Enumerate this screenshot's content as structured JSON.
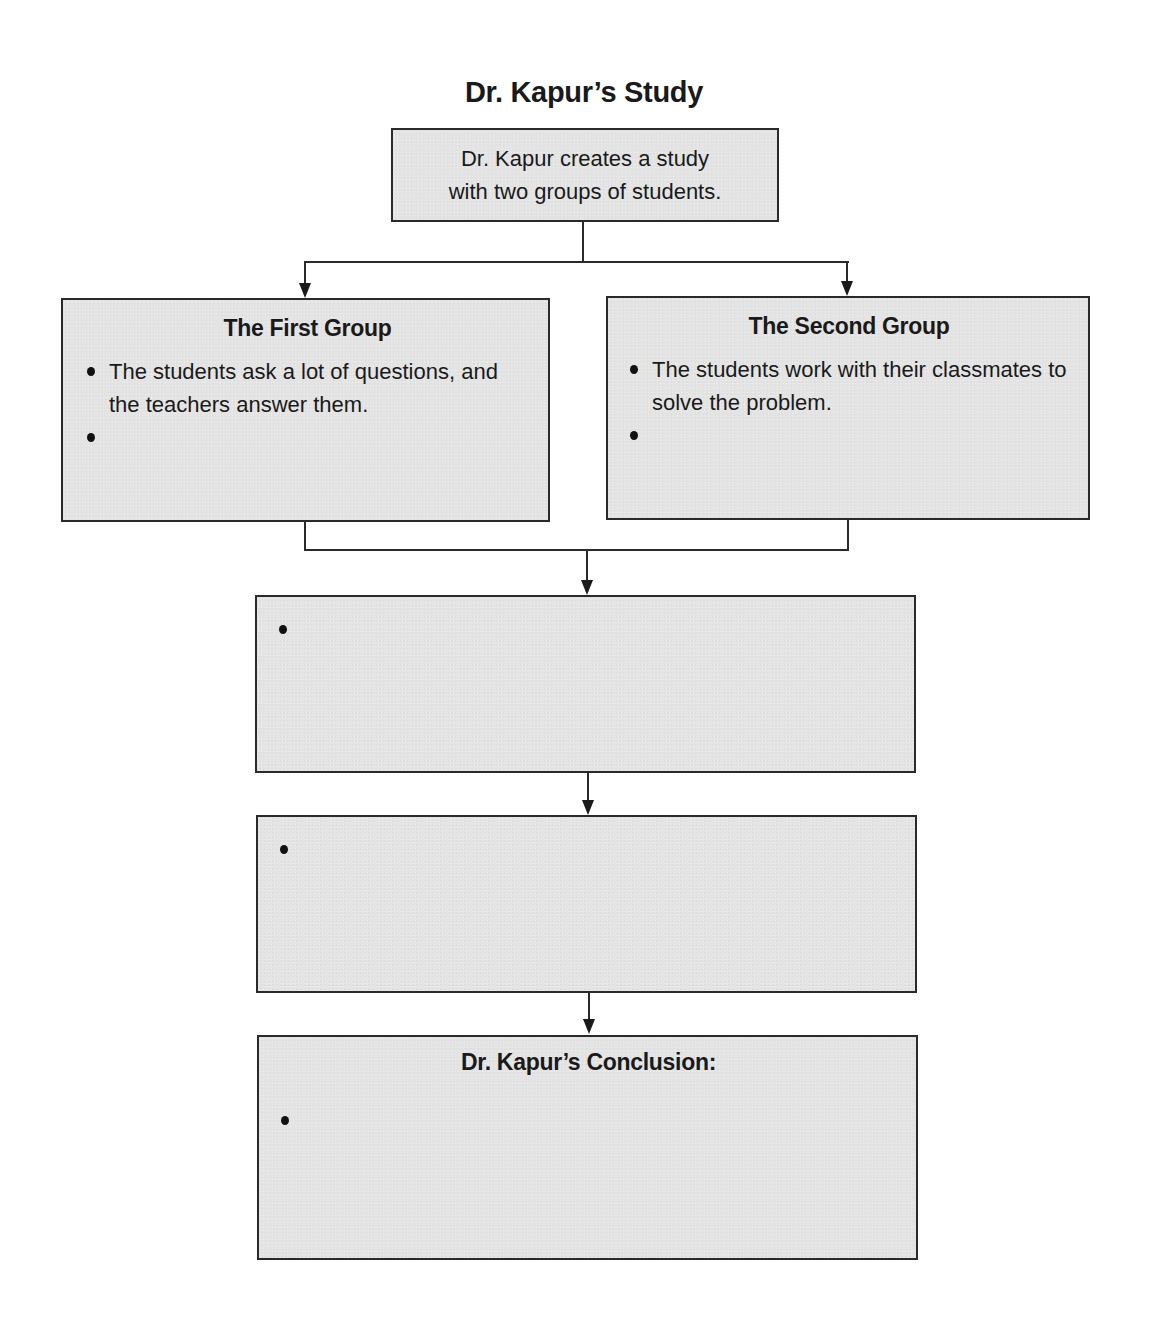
{
  "diagram": {
    "title": "Dr. Kapur’s Study",
    "start_box": {
      "line1": "Dr. Kapur creates a study",
      "line2": "with two groups of students."
    },
    "first_group": {
      "heading": "The First Group",
      "bullets": [
        "The students ask a lot of questions, and the teachers answer them.",
        ""
      ]
    },
    "second_group": {
      "heading": "The Second Group",
      "bullets": [
        "The students work with their classmates to solve the problem.",
        ""
      ]
    },
    "step_three": {
      "bullets": [
        ""
      ]
    },
    "step_four": {
      "bullets": [
        ""
      ]
    },
    "conclusion": {
      "heading": "Dr. Kapur’s Conclusion:",
      "bullets": [
        ""
      ]
    },
    "colors": {
      "box_fill": "#e4e4e4",
      "box_border": "#2a2a2a",
      "text": "#1a1a1a"
    }
  }
}
